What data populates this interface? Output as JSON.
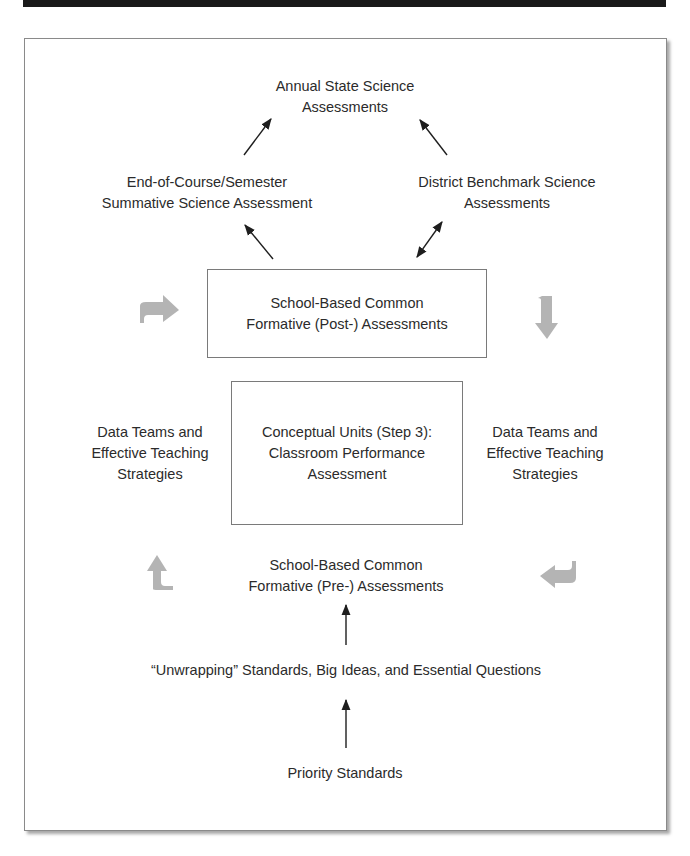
{
  "diagram": {
    "nodes": {
      "annual_state": "Annual State Science\nAssessments",
      "end_of_course": "End-of-Course/Semester\nSummative Science Assessment",
      "district_benchmark": "District Benchmark Science\nAssessments",
      "post_assessments": "School-Based Common\nFormative (Post-) Assessments",
      "data_teams_left": "Data Teams and\nEffective Teaching\nStrategies",
      "conceptual_units": "Conceptual Units (Step 3):\nClassroom Performance\nAssessment",
      "data_teams_right": "Data Teams and\nEffective Teaching\nStrategies",
      "pre_assessments": "School-Based Common\nFormative (Pre-) Assessments",
      "unwrapping": "“Unwrapping” Standards, Big Ideas, and Essential Questions",
      "priority_standards": "Priority Standards"
    },
    "edges": [
      {
        "from": "priority_standards",
        "to": "unwrapping",
        "type": "arrow"
      },
      {
        "from": "unwrapping",
        "to": "pre_assessments",
        "type": "arrow"
      },
      {
        "from": "post_assessments",
        "to": "end_of_course",
        "type": "arrow"
      },
      {
        "from": "post_assessments",
        "to": "district_benchmark",
        "type": "double-arrow"
      },
      {
        "from": "end_of_course",
        "to": "annual_state",
        "type": "arrow"
      },
      {
        "from": "district_benchmark",
        "to": "annual_state",
        "type": "arrow"
      }
    ],
    "cycle_arrows": [
      {
        "position": "upper-left",
        "direction": "right",
        "icon": "bent-arrow-right-icon"
      },
      {
        "position": "upper-right",
        "direction": "down",
        "icon": "bent-arrow-down-icon"
      },
      {
        "position": "lower-right",
        "direction": "left",
        "icon": "bent-arrow-left-icon"
      },
      {
        "position": "lower-left",
        "direction": "up",
        "icon": "bent-arrow-up-icon"
      }
    ],
    "colors": {
      "text": "#2b2b2b",
      "arrow": "#1e1e1e",
      "cycle_arrow": "#b4b4b4",
      "box_border": "#7a7a7a",
      "top_bar": "#1a1a1a"
    }
  }
}
